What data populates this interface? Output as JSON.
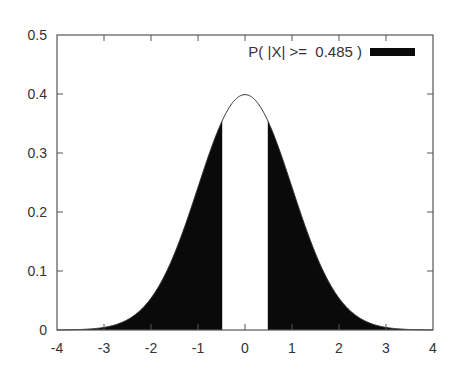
{
  "chart_data": {
    "type": "area",
    "title": "",
    "xlabel": "",
    "ylabel": "",
    "function": "standard_normal_pdf",
    "mean": 0,
    "std": 1,
    "threshold": 0.485,
    "xlim": [
      -4,
      4
    ],
    "ylim": [
      0,
      0.5
    ],
    "x_ticks": [
      -4,
      -3,
      -2,
      -1,
      0,
      1,
      2,
      3,
      4
    ],
    "x_tick_labels": [
      "-4",
      "-3",
      "-2",
      "-1",
      "0",
      "1",
      "2",
      "3",
      "4"
    ],
    "y_ticks": [
      0,
      0.1,
      0.2,
      0.3,
      0.4,
      0.5
    ],
    "y_tick_labels": [
      "0",
      "0.1",
      "0.2",
      "0.3",
      "0.4",
      "0.5"
    ],
    "peak": {
      "x": 0,
      "y": 0.399
    },
    "shaded_regions": [
      {
        "from": -4,
        "to": -0.485
      },
      {
        "from": 0.485,
        "to": 4
      }
    ],
    "legend": {
      "position": "top-right",
      "entries": [
        {
          "label": "P( |X| >=  0.485 )",
          "color": "#0a0a0a",
          "style": "filled"
        }
      ]
    },
    "grid": false,
    "colors": {
      "fill": "#0a0a0a",
      "curve": "#333333",
      "frame": "#555555",
      "text": "#333333",
      "background": "#ffffff"
    }
  }
}
